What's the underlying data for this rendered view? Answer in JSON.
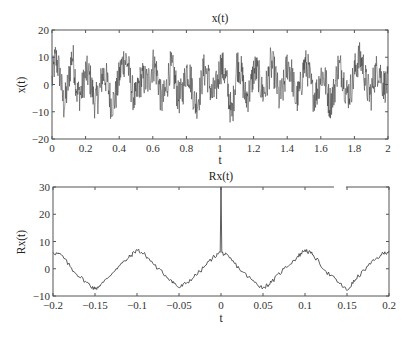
{
  "chart_data": [
    {
      "type": "line",
      "title": "x(t)",
      "xlabel": "t",
      "ylabel": "x(t)",
      "xlim": [
        0,
        2
      ],
      "ylim": [
        -20,
        20
      ],
      "xticks": [
        "0",
        "0.2",
        "0.4",
        "0.6",
        "0.8",
        "1",
        "1.2",
        "1.4",
        "1.6",
        "1.8",
        "2"
      ],
      "yticks": [
        "20",
        "10",
        "0",
        "-10",
        "-20"
      ],
      "grid": false,
      "description": "Noisy random signal with sinusoidal components, fluctuating roughly between -15 and 15 around 0",
      "series": [
        {
          "name": "x(t)",
          "x": [
            0,
            0.02,
            0.05,
            0.07,
            0.1,
            0.12,
            0.15,
            0.2,
            0.25,
            0.3,
            0.35,
            0.4,
            0.45,
            0.5,
            0.55,
            0.6,
            0.65,
            0.7,
            0.75,
            0.8,
            0.85,
            0.9,
            0.95,
            1.0,
            1.05,
            1.07,
            1.1,
            1.15,
            1.2,
            1.25,
            1.3,
            1.35,
            1.4,
            1.45,
            1.5,
            1.55,
            1.6,
            1.65,
            1.7,
            1.75,
            1.8,
            1.85,
            1.9,
            1.95,
            2.0
          ],
          "values": [
            2,
            12,
            5,
            -9,
            4,
            15,
            -6,
            8,
            -11,
            7,
            -12,
            5,
            15,
            -10,
            3,
            14,
            -11,
            11,
            -9,
            10,
            -13,
            9,
            -7,
            12,
            -6,
            -16,
            14,
            -8,
            9,
            -5,
            13,
            -9,
            14,
            -10,
            13,
            -6,
            7,
            -12,
            11,
            -5,
            8,
            14,
            -6,
            10,
            1
          ]
        }
      ]
    },
    {
      "type": "line",
      "title": "Rx(t)",
      "xlabel": "t",
      "ylabel": "Rx(t)",
      "xlim": [
        -0.2,
        0.2
      ],
      "ylim": [
        -10,
        30
      ],
      "xticks": [
        "-0.2",
        "-0.15",
        "-0.1",
        "-0.05",
        "0",
        "0.05",
        "0.1",
        "0.15",
        "0.2"
      ],
      "yticks": [
        "30",
        "20",
        "10",
        "0",
        "-10"
      ],
      "grid": false,
      "description": "Autocorrelation: periodic triangular-like wave with period 0.1 plus a sharp spike to 30 at t=0",
      "series": [
        {
          "name": "Rx(t)",
          "x": [
            -0.2,
            -0.19,
            -0.175,
            -0.16,
            -0.15,
            -0.14,
            -0.125,
            -0.11,
            -0.1,
            -0.09,
            -0.075,
            -0.06,
            -0.05,
            -0.04,
            -0.025,
            -0.01,
            -0.001,
            0,
            0.001,
            0.01,
            0.025,
            0.04,
            0.05,
            0.06,
            0.075,
            0.09,
            0.1,
            0.11,
            0.125,
            0.14,
            0.15,
            0.16,
            0.175,
            0.19,
            0.2
          ],
          "values": [
            6,
            5,
            -1,
            -5,
            -7.5,
            -5,
            0,
            4,
            7,
            5,
            0,
            -4,
            -7,
            -5,
            -1,
            4,
            6,
            30,
            6,
            4,
            -1,
            -5,
            -7,
            -5,
            0,
            4,
            7,
            5,
            -1,
            -5,
            -8,
            -4,
            1,
            5,
            6.5
          ]
        }
      ]
    }
  ],
  "plots": {
    "top": {
      "title": "x(t)",
      "xlabel": "t",
      "ylabel": "x(t)"
    },
    "bottom": {
      "title": "Rx(t)",
      "xlabel": "t",
      "ylabel": "Rx(t)"
    }
  },
  "colors": {
    "line": "#333333",
    "axes": "#555555",
    "background": "#ffffff"
  }
}
